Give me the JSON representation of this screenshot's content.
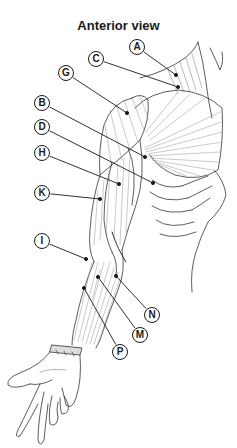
{
  "title": "Anterior view",
  "labels": [
    {
      "id": "A",
      "x": 137,
      "y": 47,
      "px": 176,
      "py": 75
    },
    {
      "id": "C",
      "x": 96,
      "y": 59,
      "px": 178,
      "py": 87
    },
    {
      "id": "G",
      "x": 66,
      "y": 73,
      "px": 127,
      "py": 113
    },
    {
      "id": "B",
      "x": 42,
      "y": 103,
      "px": 145,
      "py": 157
    },
    {
      "id": "D",
      "x": 42,
      "y": 127,
      "px": 153,
      "py": 183
    },
    {
      "id": "H",
      "x": 42,
      "y": 153,
      "px": 119,
      "py": 184
    },
    {
      "id": "K",
      "x": 42,
      "y": 193,
      "px": 100,
      "py": 199
    },
    {
      "id": "I",
      "x": 42,
      "y": 241,
      "px": 86,
      "py": 259
    },
    {
      "id": "N",
      "x": 152,
      "y": 315,
      "px": 116,
      "py": 276
    },
    {
      "id": "M",
      "x": 140,
      "y": 335,
      "px": 98,
      "py": 277
    },
    {
      "id": "P",
      "x": 120,
      "y": 352,
      "px": 84,
      "py": 288
    }
  ],
  "colors": {
    "line": "#1a1a1a",
    "muscle": "#555555",
    "background": "#ffffff"
  }
}
